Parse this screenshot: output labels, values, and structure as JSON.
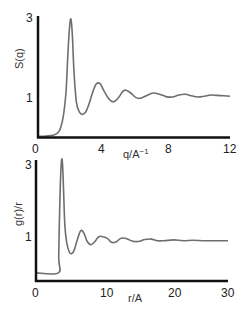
{
  "chart_data": [
    {
      "type": "line",
      "title": "",
      "xlabel": "q/A⁻¹",
      "ylabel": "S(q)",
      "xlim": [
        0,
        12
      ],
      "ylim": [
        0,
        3
      ],
      "xticks": [
        "0",
        "4",
        "8",
        "12"
      ],
      "yticks": [
        "1",
        "3"
      ],
      "grid": false,
      "legend": null,
      "series": [
        {
          "name": "S(q)",
          "x": [
            0,
            0.5,
            1.0,
            1.2,
            1.4,
            1.6,
            1.75,
            1.85,
            1.95,
            2.05,
            2.15,
            2.25,
            2.4,
            2.6,
            2.8,
            3.0,
            3.2,
            3.4,
            3.6,
            3.75,
            3.9,
            4.1,
            4.4,
            4.7,
            5.0,
            5.3,
            5.5,
            5.8,
            6.1,
            6.4,
            6.8,
            7.2,
            7.6,
            8.0,
            8.4,
            8.8,
            9.2,
            9.6,
            10.0,
            10.4,
            10.8,
            11.2,
            11.6,
            12.0
          ],
          "y": [
            0.0,
            0.01,
            0.04,
            0.08,
            0.2,
            0.55,
            1.1,
            1.9,
            2.6,
            2.92,
            2.5,
            1.6,
            0.85,
            0.6,
            0.55,
            0.62,
            0.82,
            1.08,
            1.28,
            1.33,
            1.3,
            1.15,
            0.95,
            0.86,
            0.95,
            1.12,
            1.15,
            1.08,
            0.97,
            0.95,
            1.02,
            1.08,
            1.05,
            0.99,
            0.98,
            1.03,
            1.05,
            1.01,
            0.98,
            1.0,
            1.03,
            1.02,
            1.01,
            1.0
          ]
        }
      ]
    },
    {
      "type": "line",
      "title": "",
      "xlabel": "r/A",
      "ylabel": "g(r)/r",
      "xlim": [
        0,
        30
      ],
      "ylim": [
        0,
        3
      ],
      "xticks": [
        "0",
        "10",
        "20",
        "30"
      ],
      "yticks": [
        "1",
        "3"
      ],
      "grid": false,
      "legend": null,
      "series": [
        {
          "name": "g(r)/r",
          "x": [
            0,
            3.5,
            3.55,
            3.7,
            3.9,
            4.1,
            4.3,
            4.5,
            4.8,
            5.2,
            5.6,
            6.0,
            6.5,
            7.0,
            7.5,
            8.0,
            8.6,
            9.2,
            9.8,
            10.5,
            11.2,
            11.8,
            12.5,
            13.3,
            14.2,
            15.0,
            16.0,
            17.0,
            18.0,
            19.0,
            20.0,
            21.5,
            23.0,
            24.5,
            26.0,
            27.5,
            29.0,
            30.0
          ],
          "y": [
            0.2,
            0.2,
            0.6,
            1.8,
            2.8,
            3.0,
            2.3,
            1.4,
            0.95,
            0.72,
            0.68,
            0.78,
            1.05,
            1.25,
            1.18,
            0.98,
            0.9,
            0.98,
            1.1,
            1.1,
            1.05,
            0.96,
            0.97,
            1.06,
            1.05,
            0.99,
            0.98,
            1.03,
            1.04,
            1.0,
            1.0,
            1.02,
            1.0,
            1.01,
            1.0,
            1.0,
            1.0,
            1.0
          ]
        }
      ]
    }
  ],
  "charts": {
    "top": {
      "ylabel": "S(q)",
      "xlabel_base": "q/A",
      "xlabel_sup": "−1",
      "yticks": {
        "y3": "3",
        "y1": "1"
      },
      "xticks": {
        "t0": "0",
        "t1": "4",
        "t2": "8",
        "t3": "12"
      }
    },
    "bottom": {
      "ylabel": "g(r)/r",
      "xlabel": "r/A",
      "yticks": {
        "y3": "3",
        "y1": "1"
      },
      "xticks": {
        "t0": "0",
        "t1": "10",
        "t2": "20",
        "t3": "30"
      }
    },
    "line_color": "#6e6e6e",
    "axis_color": "#111111"
  }
}
